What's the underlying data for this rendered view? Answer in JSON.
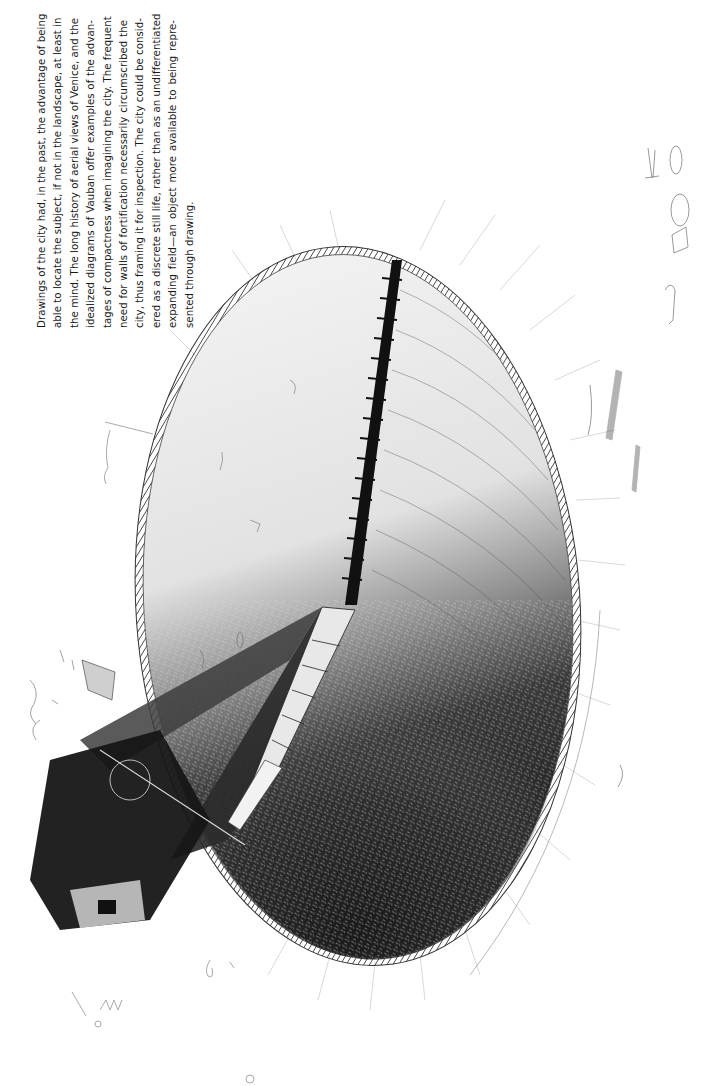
{
  "caption": {
    "lines": [
      "Drawings of the city had, in the past, the advantage of being",
      "able to locate the subject, if not in the landscape, at least in",
      "the mind. The long history of aerial views of Venice, and the",
      "idealized diagrams of Vauban offer examples of the advan-",
      "tages of compactness when imagining the city. The frequent",
      "need for walls of fortification necessarily circumscribed the",
      "city, thus framing it for inspection. The city could be consid-",
      "ered as a discrete still life, rather than as an undifferentiated",
      "expanding field—an object more available to being repre-",
      "sented through drawing."
    ],
    "orientation": "rotated -90deg (reads bottom to top)"
  },
  "figure": {
    "colors": {
      "ink": "#111111",
      "paper": "#ffffff",
      "light_fill": "#ececec",
      "dark_fill": "#2a2a2a"
    }
  }
}
